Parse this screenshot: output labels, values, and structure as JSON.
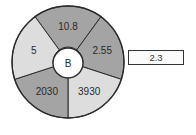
{
  "diagram": {
    "center_label": "B",
    "segments": [
      {
        "label": "10.8",
        "shade": "dark"
      },
      {
        "label": "2.55",
        "shade": "dark"
      },
      {
        "label": "3930",
        "shade": "light"
      },
      {
        "label": "2030",
        "shade": "dark"
      },
      {
        "label": "5",
        "shade": "light"
      }
    ],
    "colors": {
      "dark": "#a4a4a4",
      "light": "#dddddd",
      "center": "#ffffff",
      "stroke": "#2b2b2b"
    }
  },
  "answer_box": {
    "value": "2.3"
  }
}
